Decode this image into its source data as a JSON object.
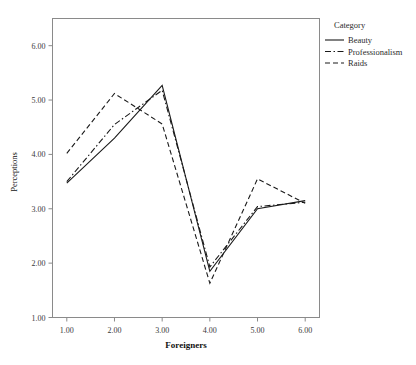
{
  "chart_data": {
    "type": "line",
    "title": "",
    "xlabel": "Foreigners",
    "ylabel": "Perceptions",
    "x": [
      1,
      2,
      3,
      4,
      5,
      6
    ],
    "xtick_labels": [
      "1.00",
      "2.00",
      "3.00",
      "4.00",
      "5.00",
      "6.00"
    ],
    "ytick_labels": [
      "1.00",
      "2.00",
      "3.00",
      "4.00",
      "5.00",
      "6.00"
    ],
    "yticks": [
      1,
      2,
      3,
      4,
      5,
      6
    ],
    "xlim": [
      0.7,
      6.3
    ],
    "ylim": [
      1.0,
      6.5
    ],
    "grid": false,
    "legend_position": "right",
    "legend_title": "Category",
    "series": [
      {
        "name": "Beauty",
        "dash": "solid",
        "values": [
          3.47,
          4.3,
          5.27,
          1.85,
          3.0,
          3.15
        ]
      },
      {
        "name": "Professionalism",
        "dash": "dashdot",
        "values": [
          3.5,
          4.55,
          5.18,
          1.93,
          3.04,
          3.12
        ]
      },
      {
        "name": "Raids",
        "dash": "dashed",
        "values": [
          4.02,
          5.12,
          4.56,
          1.63,
          3.55,
          3.1
        ]
      }
    ]
  },
  "legend": {
    "title": "Category",
    "items": [
      {
        "label": "Beauty"
      },
      {
        "label": "Professionalism"
      },
      {
        "label": "Raids"
      }
    ]
  },
  "axes": {
    "x_title": "Foreigners",
    "y_title": "Perceptions"
  },
  "colors": {
    "line": "#1a1a1a",
    "frame": "#8a8a8a",
    "background": "#ffffff"
  }
}
